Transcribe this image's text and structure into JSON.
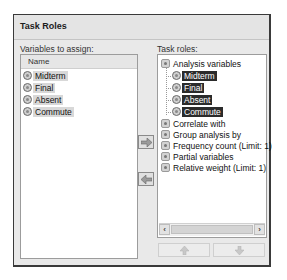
{
  "dialog": {
    "title": "Task Roles"
  },
  "left": {
    "label": "Variables to assign:",
    "column_header": "Name",
    "variables": [
      {
        "name": "Midterm",
        "icon": "numeric-variable-icon"
      },
      {
        "name": "Final",
        "icon": "numeric-variable-icon"
      },
      {
        "name": "Absent",
        "icon": "numeric-variable-icon"
      },
      {
        "name": "Commute",
        "icon": "numeric-variable-icon"
      }
    ]
  },
  "buttons": {
    "assign": "arrow-right-icon",
    "remove": "arrow-left-icon",
    "move_up": "arrow-up-icon",
    "move_down": "arrow-down-icon"
  },
  "right": {
    "label": "Task roles:",
    "roles": [
      {
        "label": "Analysis variables",
        "children": [
          "Midterm",
          "Final",
          "Absent",
          "Commute"
        ]
      },
      {
        "label": "Correlate with",
        "children": []
      },
      {
        "label": "Group analysis by",
        "children": []
      },
      {
        "label": "Frequency count  (Limit: 1)",
        "children": []
      },
      {
        "label": "Partial variables",
        "children": []
      },
      {
        "label": "Relative weight  (Limit: 1)",
        "children": []
      }
    ],
    "scroll_left": "‹",
    "scroll_right": "›"
  },
  "colors": {
    "dialog_bg": "#e9e9e9",
    "selection_dark": "#2b2b2b",
    "selection_light": "#d8d8d8"
  }
}
